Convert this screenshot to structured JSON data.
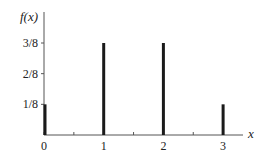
{
  "chart_data": {
    "type": "bar",
    "title": "",
    "xlabel": "x",
    "ylabel": "f(x)",
    "categories": [
      "0",
      "1",
      "2",
      "3"
    ],
    "x": [
      0,
      1,
      2,
      3
    ],
    "values": [
      0.125,
      0.375,
      0.375,
      0.125
    ],
    "value_labels": [
      "1/8",
      "3/8",
      "3/8",
      "1/8"
    ],
    "yticks": [
      0.125,
      0.25,
      0.375
    ],
    "ytick_labels": [
      "1/8",
      "2/8",
      "3/8"
    ],
    "xticks": [
      0,
      0.5,
      1,
      1.5,
      2,
      2.5,
      3
    ],
    "xtick_labels": [
      "0",
      "",
      "1",
      "",
      "2",
      "",
      "3"
    ],
    "ylim": [
      0,
      0.45
    ],
    "xlim": [
      0,
      3.33
    ],
    "grid": false,
    "legend": null,
    "bar_color": "#1a1a1a"
  }
}
